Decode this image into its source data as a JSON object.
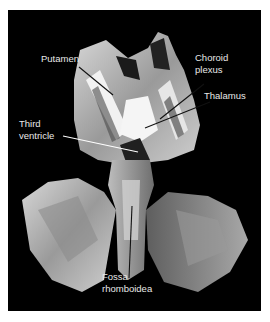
{
  "figure": {
    "background_color": "#000000",
    "labels": [
      {
        "id": "putamen",
        "text": "Putamen"
      },
      {
        "id": "choroid_plexus_line1",
        "text": "Choroid"
      },
      {
        "id": "choroid_plexus_line2",
        "text": "plexus"
      },
      {
        "id": "thalamus",
        "text": "Thalamus"
      },
      {
        "id": "third_ventricle_line1",
        "text": "Third"
      },
      {
        "id": "third_ventricle_line2",
        "text": "ventricle"
      },
      {
        "id": "fossa_line1",
        "text": "Fossa"
      },
      {
        "id": "fossa_line2",
        "text": "rhomboidea"
      }
    ]
  }
}
